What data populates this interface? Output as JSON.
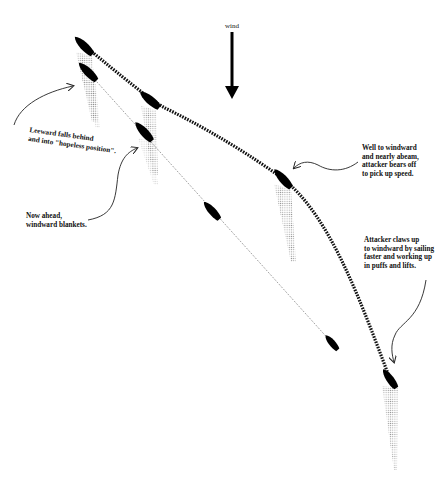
{
  "diagram": {
    "wind": {
      "label": "wind",
      "direction": "down",
      "x": 232,
      "y_start": 32,
      "y_end": 98
    },
    "annotations": [
      {
        "id": "leeward-falls",
        "text": "Leeward falls behind\nand into \"hopeless position\".",
        "x": 30,
        "y": 126,
        "rotate": 8
      },
      {
        "id": "now-ahead",
        "text": "Now ahead,\nwindward blankets.",
        "x": 26,
        "y": 212,
        "rotate": 0
      },
      {
        "id": "well-to-windward",
        "text": "Well to windward\nand nearly abeam,\nattacker bears off\nto pick up speed.",
        "x": 362,
        "y": 144,
        "rotate": 0
      },
      {
        "id": "attacker-claws",
        "text": "Attacker claws up\nto windward by sailing\nfaster and working up\nin puffs and lifts.",
        "x": 364,
        "y": 236,
        "rotate": 0
      }
    ],
    "windward_boat_positions": [
      {
        "x": 84,
        "y": 46,
        "angle": 45
      },
      {
        "x": 150,
        "y": 100,
        "angle": 45
      },
      {
        "x": 282,
        "y": 178,
        "angle": 50
      },
      {
        "x": 390,
        "y": 379,
        "angle": 55
      }
    ],
    "leeward_boat_positions": [
      {
        "x": 88,
        "y": 72,
        "angle": 45
      },
      {
        "x": 144,
        "y": 132,
        "angle": 45
      },
      {
        "x": 212,
        "y": 211,
        "angle": 45
      },
      {
        "x": 332,
        "y": 343,
        "angle": 45
      }
    ],
    "colors": {
      "boat": "#000000",
      "track": "#111111",
      "wind_shadow": "#9a9a9a",
      "background": "#ffffff"
    }
  }
}
